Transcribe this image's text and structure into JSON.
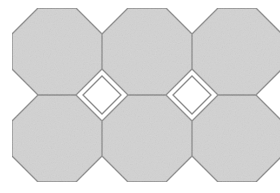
{
  "figure": {
    "name": "octagon-tiling-pattern",
    "width": 280,
    "height": 193,
    "background_color": "#ffffff"
  },
  "style": {
    "tile_fill_color": "#d2d2d2",
    "tile_stroke_color": "#8a8a8a",
    "tile_stroke_width": 1.3,
    "gap_fill_color": "#ffffff",
    "gap_stroke_color": "#8a8a8a",
    "gap_stroke_width": 1.3,
    "noise_opacity": 0.05
  },
  "grid": {
    "columns": 3,
    "rows": 2,
    "pitch_x": 90,
    "pitch_y": 87,
    "origin_x": 12,
    "origin_y": 8,
    "chamfer": 26
  },
  "tiles": [
    {
      "label": "octagon-r1-c1",
      "cx": 57,
      "cy": 51.5
    },
    {
      "label": "octagon-r1-c2",
      "cx": 147,
      "cy": 51.5
    },
    {
      "label": "octagon-r1-c3",
      "cx": 237,
      "cy": 51.5
    },
    {
      "label": "octagon-r2-c1",
      "cx": 57,
      "cy": 138.5
    },
    {
      "label": "octagon-r2-c2",
      "cx": 147,
      "cy": 138.5
    },
    {
      "label": "octagon-r2-c3",
      "cx": 237,
      "cy": 138.5
    }
  ],
  "gaps": [
    {
      "label": "square-gap-left",
      "cx": 102,
      "cy": 95,
      "half_diagonal": 19
    },
    {
      "label": "square-gap-right",
      "cx": 192,
      "cy": 95,
      "half_diagonal": 19
    }
  ]
}
